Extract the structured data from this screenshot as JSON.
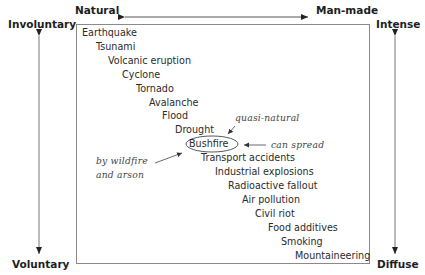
{
  "axes": {
    "top_left": "Natural",
    "top_right": "Man-made",
    "left_top": "Involuntary",
    "left_bottom": "Voluntary",
    "right_top": "Intense",
    "right_bottom": "Diffuse"
  },
  "hazards": [
    "Earthquake",
    "Tsunami",
    "Volcanic eruption",
    "Cyclone",
    "Tornado",
    "Avalanche",
    "Flood",
    "Drought",
    "Bushfire",
    "Transport accidents",
    "Industrial explosions",
    "Radioactive fallout",
    "Air pollution",
    "Civil riot",
    "Food additives",
    "Smoking",
    "Mountaineering"
  ],
  "annotations": {
    "quasi_natural": "quasi-natural",
    "can_spread": "can spread",
    "wildfire_line1": "by wildfire",
    "wildfire_line2": "and arson"
  },
  "highlighted_item": "Bushfire"
}
